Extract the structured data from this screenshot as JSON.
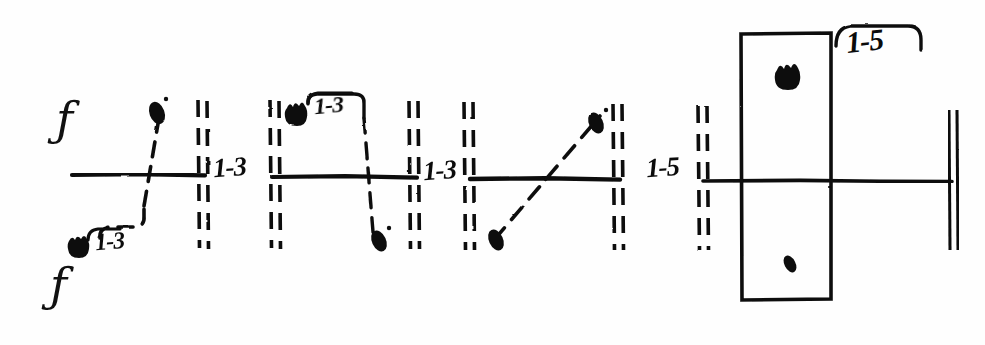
{
  "diagram": {
    "ink_color": "#0b0b0b",
    "paper_color": "#fefefe",
    "width": 985,
    "height": 345,
    "baseline_y": 175,
    "staff_labels": [
      {
        "name": "f-clef-top",
        "text": "ƒ",
        "x": 58,
        "y": 100
      },
      {
        "name": "f-clef-bottom",
        "text": "ƒ",
        "x": 52,
        "y": 268
      }
    ],
    "segment_labels": [
      {
        "name": "label-segment-1",
        "text": "1-3",
        "x": 214,
        "y": 155,
        "style": "inline"
      },
      {
        "name": "label-segment-2",
        "text": "1-3",
        "x": 424,
        "y": 157,
        "style": "inline"
      },
      {
        "name": "label-segment-3",
        "text": "1-5",
        "x": 648,
        "y": 155,
        "style": "inline"
      },
      {
        "name": "label-bracket-lower-left",
        "text": "1-3",
        "x": 93,
        "y": 228,
        "style": "bracket"
      },
      {
        "name": "label-bracket-upper-mid",
        "text": "1-3",
        "x": 312,
        "y": 93,
        "style": "bracket"
      },
      {
        "name": "label-bracket-box",
        "text": "1-5",
        "x": 845,
        "y": 22,
        "style": "bracket"
      }
    ],
    "barlines": [
      {
        "name": "dashed-barline-1",
        "x": 200,
        "y1": 100,
        "y2": 248
      },
      {
        "name": "dashed-barline-2",
        "x": 272,
        "y1": 100,
        "y2": 248
      },
      {
        "name": "dashed-barline-3",
        "x": 411,
        "y1": 100,
        "y2": 248
      },
      {
        "name": "dashed-barline-4",
        "x": 466,
        "y1": 100,
        "y2": 248
      },
      {
        "name": "dashed-barline-5",
        "x": 615,
        "y1": 100,
        "y2": 248
      },
      {
        "name": "dashed-barline-6",
        "x": 700,
        "y1": 100,
        "y2": 248
      }
    ],
    "end_barline": {
      "name": "final-double-barline",
      "x": 952,
      "y1": 110,
      "y2": 250
    },
    "staff_segments": [
      {
        "name": "staff-line-seg-1",
        "x1": 72,
        "x2": 205,
        "y": 175
      },
      {
        "name": "staff-line-seg-2",
        "x1": 272,
        "x2": 417,
        "y": 177
      },
      {
        "name": "staff-line-seg-3",
        "x1": 470,
        "x2": 620,
        "y": 179
      },
      {
        "name": "staff-line-seg-4",
        "x1": 703,
        "x2": 952,
        "y": 181
      }
    ],
    "note_heads": [
      {
        "name": "note-head-1-upper",
        "x": 157,
        "y": 113,
        "shape": "oval",
        "rot": -20
      },
      {
        "name": "note-head-1-lower",
        "x": 81,
        "y": 249,
        "shape": "crown",
        "rot": 0
      },
      {
        "name": "note-head-2-upper",
        "x": 299,
        "y": 115,
        "shape": "crown",
        "rot": 0
      },
      {
        "name": "note-head-2-lower",
        "x": 379,
        "y": 238,
        "shape": "oval",
        "rot": -25
      },
      {
        "name": "note-head-3-upper",
        "x": 595,
        "y": 123,
        "shape": "oval",
        "rot": -25
      },
      {
        "name": "note-head-3-lower",
        "x": 497,
        "y": 238,
        "shape": "oval",
        "rot": -25
      },
      {
        "name": "note-head-box-upper",
        "x": 789,
        "y": 77,
        "shape": "crown",
        "rot": 0
      },
      {
        "name": "note-head-box-lower",
        "x": 790,
        "y": 264,
        "shape": "oval",
        "rot": -25
      }
    ],
    "glissandi": [
      {
        "name": "gliss-seg-1",
        "from_x": 107,
        "from_y": 236,
        "to_x": 160,
        "to_y": 108,
        "kind": "stepped-rise"
      },
      {
        "name": "gliss-seg-2",
        "from_x": 307,
        "from_y": 106,
        "to_x": 376,
        "to_y": 232,
        "kind": "bracket-fall"
      },
      {
        "name": "gliss-seg-3",
        "from_x": 497,
        "from_y": 236,
        "to_x": 598,
        "to_y": 118,
        "kind": "straight-rise"
      }
    ],
    "box": {
      "name": "event-box",
      "x": 741,
      "y": 33,
      "width": 90,
      "height": 266
    }
  }
}
